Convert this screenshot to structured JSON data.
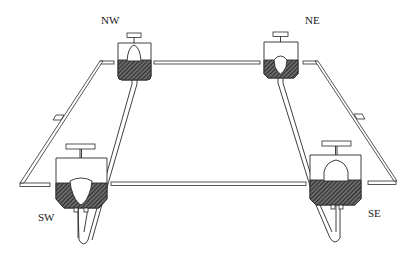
{
  "figure": {
    "type": "line-drawing",
    "colors": {
      "ink": "#2a2a2a",
      "background": "#ffffff",
      "hatch": "#555555"
    }
  },
  "stations": [
    {
      "id": "nw",
      "label": "NW"
    },
    {
      "id": "ne",
      "label": "NE"
    },
    {
      "id": "sw",
      "label": "SW"
    },
    {
      "id": "se",
      "label": "SE"
    }
  ]
}
